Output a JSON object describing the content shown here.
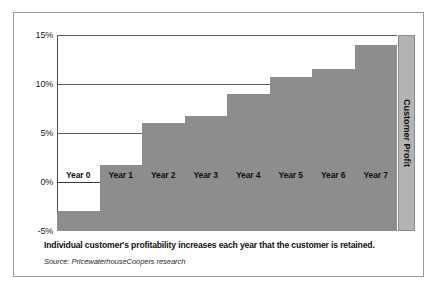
{
  "chart_data": {
    "type": "bar",
    "title": "",
    "subtitle": "",
    "xlabel": "",
    "ylabel": "Customer Profit",
    "categories": [
      "Year 0",
      "Year 1",
      "Year 2",
      "Year 3",
      "Year 4",
      "Year 5",
      "Year 6",
      "Year 7"
    ],
    "values": [
      -3.0,
      1.7,
      6.0,
      6.7,
      9.0,
      10.7,
      11.5,
      14.0
    ],
    "value_unit": "percent",
    "baseline": -5.0,
    "ylim": [
      -5,
      15
    ],
    "yticks": [
      15,
      10,
      5,
      0,
      -5
    ],
    "ytick_labels": [
      "15%",
      "10%",
      "5%",
      "0%",
      "-5%"
    ],
    "gridlines": [
      15,
      10,
      5,
      0
    ],
    "grid": true,
    "legend": "none",
    "bar_color": "#8d8d8d",
    "band_color": "#b4b4b4",
    "axis_color": "#4a4a4a"
  },
  "axis": {
    "side_label": "Customer Profit"
  },
  "footer": {
    "caption": "Individual customer's profitability increases each year that the customer is retained.",
    "source": "Source: PricewaterhouseCoopers research"
  }
}
